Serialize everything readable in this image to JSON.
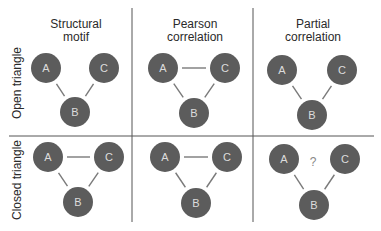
{
  "columns": [
    {
      "line1": "Structural",
      "line2": "motif",
      "cx": 76
    },
    {
      "line1": "Pearson",
      "line2": "correlation",
      "cx": 195
    },
    {
      "line1": "Partial",
      "line2": "correlation",
      "cx": 313
    }
  ],
  "rows": [
    {
      "label": "Open triangle",
      "cy": 83
    },
    {
      "label": "Closed triangle",
      "cy": 180
    }
  ],
  "node_labels": {
    "a": "A",
    "b": "B",
    "c": "C"
  },
  "unknown_marker": "?",
  "colors": {
    "node_fill": "#5c5c5c",
    "node_text": "#dcdcdc",
    "edge": "#7a7a7a",
    "grid": "#555555",
    "text": "#2a2a2a",
    "question": "#888888"
  },
  "panels": [
    {
      "row": "open",
      "column": "structural",
      "A": [
        46,
        68
      ],
      "C": [
        104,
        68
      ],
      "B": [
        75,
        112
      ],
      "edges": [
        "A-B",
        "B-C"
      ]
    },
    {
      "row": "open",
      "column": "pearson",
      "A": [
        163,
        68
      ],
      "C": [
        225,
        68
      ],
      "B": [
        194,
        113
      ],
      "edges": [
        "A-B",
        "B-C",
        "A-C"
      ]
    },
    {
      "row": "open",
      "column": "partial",
      "A": [
        282,
        70
      ],
      "C": [
        342,
        70
      ],
      "B": [
        312,
        115
      ],
      "edges": [
        "A-B",
        "B-C"
      ]
    },
    {
      "row": "closed",
      "column": "structural",
      "A": [
        48,
        157
      ],
      "C": [
        109,
        157
      ],
      "B": [
        78,
        202
      ],
      "edges": [
        "A-B",
        "B-C",
        "A-C"
      ]
    },
    {
      "row": "closed",
      "column": "pearson",
      "A": [
        165,
        157
      ],
      "C": [
        227,
        157
      ],
      "B": [
        196,
        203
      ],
      "edges": [
        "A-B",
        "B-C",
        "A-C"
      ]
    },
    {
      "row": "closed",
      "column": "partial",
      "A": [
        284,
        159
      ],
      "C": [
        345,
        159
      ],
      "B": [
        314,
        205
      ],
      "edges": [
        "A-B",
        "B-C"
      ],
      "question": [
        313,
        162
      ]
    }
  ]
}
